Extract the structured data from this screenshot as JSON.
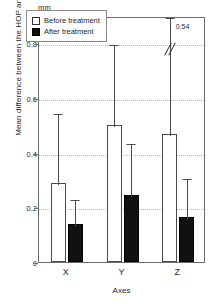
{
  "chart_data": {
    "type": "bar",
    "title": "",
    "unit_label": "mm",
    "xlabel": "Axes",
    "ylabel": "Mean difference between the HOP and BPOP",
    "categories": [
      "X",
      "Y",
      "Z"
    ],
    "ylim": [
      0,
      0.9
    ],
    "yticks": [
      0,
      0.2,
      0.4,
      0.6,
      0.8
    ],
    "ytick_labels": [
      "0",
      "0.2",
      "0.4",
      "0.6",
      "0.8"
    ],
    "grid": true,
    "legend_position": "top-left",
    "series": [
      {
        "name": "Before treatment",
        "color": "#ffffff",
        "values": [
          0.29,
          0.5,
          0.47
        ],
        "error_upper": [
          0.55,
          0.8,
          0.9
        ],
        "truncated": [
          false,
          false,
          true
        ]
      },
      {
        "name": "After treatment",
        "color": "#111111",
        "values": [
          0.14,
          0.245,
          0.165
        ],
        "error_upper": [
          0.235,
          0.44,
          0.31
        ],
        "truncated": [
          false,
          false,
          false
        ]
      }
    ],
    "annotations": [
      {
        "text": "0.54",
        "category": "Z",
        "series": "Before treatment",
        "note": "true upper error value of truncated bar"
      }
    ]
  },
  "legend": {
    "items": [
      {
        "label": "Before treatment",
        "swatch": "white-square"
      },
      {
        "label": "After treatment",
        "swatch": "black-square"
      }
    ]
  }
}
